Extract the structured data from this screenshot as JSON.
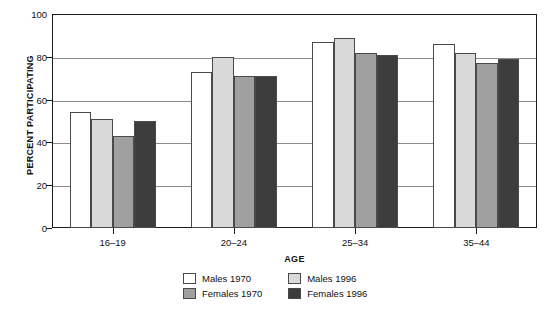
{
  "chart_data": {
    "type": "bar",
    "title": "",
    "xlabel": "AGE",
    "ylabel": "PERCENT PARTICIPATING",
    "categories": [
      "16–19",
      "20–24",
      "25–34",
      "35–44"
    ],
    "series": [
      {
        "name": "Males 1970",
        "color": "#ffffff",
        "values": [
          54,
          73,
          87,
          86
        ]
      },
      {
        "name": "Males 1996",
        "color": "#d9d9d9",
        "values": [
          51,
          80,
          89,
          82
        ]
      },
      {
        "name": "Females 1970",
        "color": "#a0a0a0",
        "values": [
          43,
          71,
          82,
          77
        ]
      },
      {
        "name": "Females 1996",
        "color": "#3d3d3d",
        "values": [
          50,
          71,
          81,
          79
        ]
      }
    ],
    "ylim": [
      0,
      100
    ],
    "yticks": [
      0,
      20,
      40,
      60,
      80,
      100
    ],
    "ytick_labels": [
      "0",
      "20",
      "40",
      "60",
      "80",
      "100"
    ],
    "grid": true,
    "grid_axis": "y",
    "legend_position": "bottom-center",
    "legend_order": [
      "Males 1970",
      "Males 1996",
      "Females 1970",
      "Females 1996"
    ]
  },
  "axes": {
    "y_title": "PERCENT PARTICIPATING",
    "x_title": "AGE"
  },
  "colors": {
    "frame": "#1a1a1a",
    "gridline": "#8d8d8d",
    "bar_outline": "#4a4a4a",
    "males_1970": "#ffffff",
    "males_1996": "#d9d9d9",
    "females_1970": "#a0a0a0",
    "females_1996": "#3d3d3d"
  }
}
